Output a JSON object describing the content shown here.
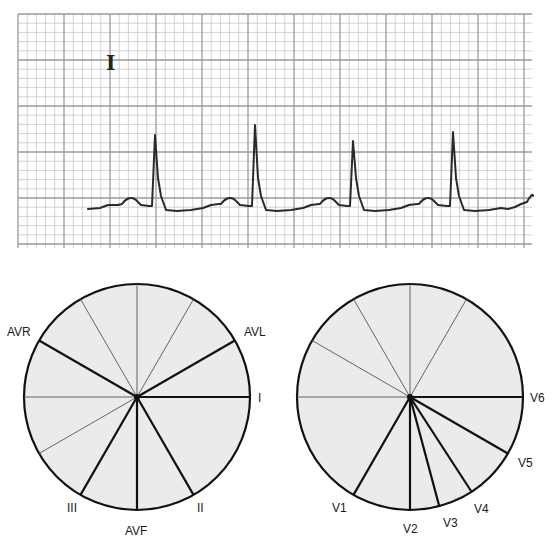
{
  "ecg_strip": {
    "lead_label": "I",
    "grid": {
      "x0": 18,
      "y0": 14,
      "x1": 532,
      "y1": 248,
      "minor_px": 9.2,
      "major_every": 5,
      "minor_color": "#c8c8c8",
      "major_color": "#9a9a9a"
    },
    "trace_color": "#2a2a2a",
    "baseline_y": 208,
    "beats": [
      {
        "p_x": 130,
        "r_x": 155,
        "r_y": 135
      },
      {
        "p_x": 229,
        "r_x": 255,
        "r_y": 125
      },
      {
        "p_x": 328,
        "r_x": 353,
        "r_y": 141
      },
      {
        "p_x": 427,
        "r_x": 453,
        "r_y": 132
      }
    ]
  },
  "limb_leads_diagram": {
    "title": "Limb leads (frontal plane)",
    "center": [
      137,
      397
    ],
    "radius": 113,
    "fill": "#ebebeb",
    "thin_lines_deg": [
      -90,
      -60,
      -120,
      180,
      150
    ],
    "leads": [
      {
        "name": "I",
        "angle": 0,
        "label_x": 258,
        "label_y": 402
      },
      {
        "name": "AVL",
        "angle": -30,
        "label_x": 244,
        "label_y": 336
      },
      {
        "name": "AVR",
        "angle": -150,
        "label_x": 7,
        "label_y": 336
      },
      {
        "name": "II",
        "angle": 60,
        "label_x": 197,
        "label_y": 512
      },
      {
        "name": "III",
        "angle": 120,
        "label_x": 67,
        "label_y": 512
      },
      {
        "name": "AVF",
        "angle": 90,
        "label_x": 125,
        "label_y": 535
      }
    ]
  },
  "precordial_leads_diagram": {
    "title": "Precordial leads (horizontal plane)",
    "center": [
      410,
      397
    ],
    "radius": 113,
    "fill": "#ebebeb",
    "thin_lines_deg": [
      -90,
      -60,
      -120,
      -150,
      180
    ],
    "leads": [
      {
        "name": "V6",
        "angle": 0,
        "label_x": 530,
        "label_y": 402
      },
      {
        "name": "V5",
        "angle": 30,
        "label_x": 518,
        "label_y": 467
      },
      {
        "name": "V4",
        "angle": 57,
        "label_x": 474,
        "label_y": 513
      },
      {
        "name": "V3",
        "angle": 75,
        "label_x": 443,
        "label_y": 527
      },
      {
        "name": "V2",
        "angle": 90,
        "label_x": 403,
        "label_y": 533
      },
      {
        "name": "V1",
        "angle": 120,
        "label_x": 332,
        "label_y": 512
      }
    ]
  }
}
